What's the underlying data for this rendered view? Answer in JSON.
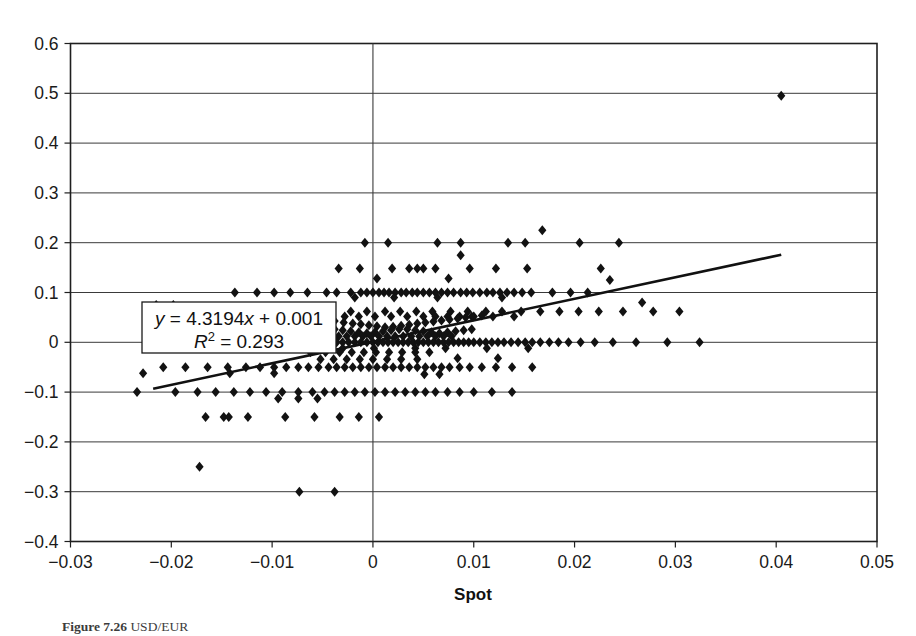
{
  "figure": {
    "caption_prefix": "Figure 7.26",
    "caption_rest": "  USD/EUR",
    "caption_visible": true
  },
  "chart_data": {
    "type": "scatter",
    "title": "",
    "xlabel": "Spot",
    "ylabel": "",
    "xlim": [
      -0.03,
      0.05
    ],
    "ylim": [
      -0.4,
      0.6
    ],
    "xticks": [
      "-0.03",
      "-0.02",
      "-0.01",
      "0",
      "0.01",
      "0.02",
      "0.03",
      "0.04",
      "0.05"
    ],
    "xtick_values": [
      -0.03,
      -0.02,
      -0.01,
      0,
      0.01,
      0.02,
      0.03,
      0.04,
      0.05
    ],
    "yticks": [
      "0.6",
      "0.5",
      "0.4",
      "0.3",
      "0.2",
      "0.1",
      "0",
      "-0.1",
      "-0.2",
      "-0.3",
      "-0.4"
    ],
    "ytick_values": [
      0.6,
      0.5,
      0.4,
      0.3,
      0.2,
      0.1,
      0,
      -0.1,
      -0.2,
      -0.3,
      -0.4
    ],
    "grid": {
      "horizontal": true,
      "vertical": false,
      "zero_vertical_line": true
    },
    "legend": {
      "present": false,
      "position": "none"
    },
    "annotations": [
      {
        "name": "regression-equation",
        "line1": "y = 4.3194x + 0.001",
        "line2": "R2 = 0.293",
        "equation_lhs": "y",
        "equation_rhs": " = 4.3194",
        "equation_var": "x",
        "equation_const": " + 0.001",
        "r2_symbol": "R",
        "r2_exp": "2",
        "r2_value": " = 0.293",
        "boxed": true
      }
    ],
    "trendline": {
      "type": "linear",
      "slope": 4.3194,
      "intercept": 0.001,
      "r_squared": 0.293,
      "x_start": -0.0218,
      "x_end": 0.0405,
      "y_start": -0.0932,
      "y_end": 0.1759
    },
    "marker": {
      "shape": "diamond",
      "color": "#121212",
      "size": 5
    },
    "points": [
      [
        0.0405,
        0.495
      ],
      [
        0.0168,
        0.225
      ],
      [
        0.0134,
        0.2
      ],
      [
        0.0205,
        0.2
      ],
      [
        0.0244,
        0.2
      ],
      [
        0.0064,
        0.2
      ],
      [
        0.0087,
        0.2
      ],
      [
        0.0015,
        0.2
      ],
      [
        0.0151,
        0.2
      ],
      [
        -0.0008,
        0.2
      ],
      [
        0.0087,
        0.175
      ],
      [
        0.0226,
        0.148
      ],
      [
        0.0019,
        0.148
      ],
      [
        -0.0034,
        0.148
      ],
      [
        -0.0013,
        0.148
      ],
      [
        0.0036,
        0.148
      ],
      [
        0.0044,
        0.148
      ],
      [
        0.005,
        0.148
      ],
      [
        0.0062,
        0.148
      ],
      [
        0.0096,
        0.148
      ],
      [
        0.0122,
        0.148
      ],
      [
        0.0153,
        0.148
      ],
      [
        0.0075,
        0.128
      ],
      [
        0.0004,
        0.128
      ],
      [
        0.0235,
        0.125
      ],
      [
        -0.0046,
        0.1
      ],
      [
        -0.0036,
        0.1
      ],
      [
        -0.0022,
        0.1
      ],
      [
        -0.0012,
        0.1
      ],
      [
        -0.0006,
        0.1
      ],
      [
        0.0,
        0.1
      ],
      [
        0.0006,
        0.1
      ],
      [
        0.0011,
        0.1
      ],
      [
        0.0016,
        0.1
      ],
      [
        0.0022,
        0.1
      ],
      [
        0.0028,
        0.1
      ],
      [
        0.0033,
        0.1
      ],
      [
        0.0039,
        0.1
      ],
      [
        0.0044,
        0.1
      ],
      [
        0.005,
        0.1
      ],
      [
        0.0056,
        0.1
      ],
      [
        0.0062,
        0.1
      ],
      [
        0.0068,
        0.1
      ],
      [
        0.0074,
        0.1
      ],
      [
        0.008,
        0.1
      ],
      [
        0.0087,
        0.1
      ],
      [
        0.0093,
        0.1
      ],
      [
        0.0099,
        0.1
      ],
      [
        0.0106,
        0.1
      ],
      [
        0.0113,
        0.1
      ],
      [
        0.0119,
        0.1
      ],
      [
        0.0126,
        0.1
      ],
      [
        0.0133,
        0.1
      ],
      [
        0.014,
        0.1
      ],
      [
        0.0148,
        0.1
      ],
      [
        0.0157,
        0.1
      ],
      [
        -0.0065,
        0.1
      ],
      [
        -0.0082,
        0.1
      ],
      [
        -0.0098,
        0.1
      ],
      [
        -0.0115,
        0.1
      ],
      [
        -0.0137,
        0.1
      ],
      [
        0.0178,
        0.1
      ],
      [
        0.0196,
        0.1
      ],
      [
        0.0213,
        0.1
      ],
      [
        0.0064,
        0.09
      ],
      [
        0.0128,
        0.09
      ],
      [
        -0.0018,
        0.09
      ],
      [
        0.0021,
        0.09
      ],
      [
        0.0267,
        0.08
      ],
      [
        -0.0215,
        0.075
      ],
      [
        -0.0198,
        0.075
      ],
      [
        -0.0062,
        0.062
      ],
      [
        -0.0041,
        0.062
      ],
      [
        -0.0022,
        0.062
      ],
      [
        -0.0006,
        0.062
      ],
      [
        0.0012,
        0.062
      ],
      [
        0.0027,
        0.062
      ],
      [
        0.0043,
        0.062
      ],
      [
        0.0059,
        0.062
      ],
      [
        0.0077,
        0.062
      ],
      [
        0.0094,
        0.062
      ],
      [
        0.0112,
        0.062
      ],
      [
        0.0128,
        0.062
      ],
      [
        0.0147,
        0.062
      ],
      [
        0.0166,
        0.062
      ],
      [
        0.0185,
        0.062
      ],
      [
        0.0204,
        0.062
      ],
      [
        0.0224,
        0.062
      ],
      [
        0.0248,
        0.062
      ],
      [
        0.0278,
        0.062
      ],
      [
        0.0304,
        0.062
      ],
      [
        -0.0082,
        0.062
      ],
      [
        -0.0104,
        0.062
      ],
      [
        -0.0126,
        0.062
      ],
      [
        0.005,
        0.052
      ],
      [
        0.0062,
        0.052
      ],
      [
        0.0074,
        0.052
      ],
      [
        0.0086,
        0.052
      ],
      [
        0.0098,
        0.052
      ],
      [
        0.0034,
        0.052
      ],
      [
        0.0018,
        0.052
      ],
      [
        0.0002,
        0.052
      ],
      [
        -0.0014,
        0.052
      ],
      [
        -0.0028,
        0.052
      ],
      [
        -0.0042,
        0.052
      ],
      [
        0.0119,
        0.052
      ],
      [
        0.014,
        0.052
      ],
      [
        -0.0049,
        0.045
      ],
      [
        -0.0038,
        0.043
      ],
      [
        -0.0029,
        0.04
      ],
      [
        -0.002,
        0.038
      ],
      [
        -0.0012,
        0.036
      ],
      [
        -0.0004,
        0.034
      ],
      [
        0.0004,
        0.032
      ],
      [
        0.0012,
        0.03
      ],
      [
        0.002,
        0.031
      ],
      [
        0.0028,
        0.033
      ],
      [
        0.0036,
        0.035
      ],
      [
        0.0044,
        0.038
      ],
      [
        0.0052,
        0.04
      ],
      [
        0.006,
        0.042
      ],
      [
        0.0068,
        0.044
      ],
      [
        0.0076,
        0.046
      ],
      [
        0.0084,
        0.048
      ],
      [
        0.0092,
        0.05
      ],
      [
        0.01,
        0.052
      ],
      [
        0.0108,
        0.054
      ],
      [
        -0.0046,
        0.028
      ],
      [
        -0.0038,
        0.026
      ],
      [
        -0.003,
        0.024
      ],
      [
        -0.0022,
        0.022
      ],
      [
        -0.0014,
        0.02
      ],
      [
        -0.0006,
        0.018
      ],
      [
        0.0002,
        0.02
      ],
      [
        0.001,
        0.022
      ],
      [
        0.0018,
        0.024
      ],
      [
        0.0026,
        0.026
      ],
      [
        0.0034,
        0.026
      ],
      [
        0.0042,
        0.024
      ],
      [
        0.005,
        0.022
      ],
      [
        0.0058,
        0.02
      ],
      [
        0.0066,
        0.018
      ],
      [
        0.0074,
        0.02
      ],
      [
        0.0082,
        0.022
      ],
      [
        0.009,
        0.024
      ],
      [
        0.0098,
        0.026
      ],
      [
        -0.0042,
        0.012
      ],
      [
        -0.0034,
        0.012
      ],
      [
        -0.0026,
        0.012
      ],
      [
        -0.0018,
        0.012
      ],
      [
        -0.001,
        0.012
      ],
      [
        -0.0002,
        0.012
      ],
      [
        0.0006,
        0.012
      ],
      [
        0.0014,
        0.012
      ],
      [
        0.0022,
        0.012
      ],
      [
        0.003,
        0.012
      ],
      [
        0.0038,
        0.012
      ],
      [
        0.0046,
        0.012
      ],
      [
        0.0054,
        0.012
      ],
      [
        0.0062,
        0.012
      ],
      [
        0.007,
        0.012
      ],
      [
        0.0078,
        0.012
      ],
      [
        -0.0072,
        0.012
      ],
      [
        -0.0088,
        0.012
      ],
      [
        -0.0219,
        0.0
      ],
      [
        -0.02,
        0.0
      ],
      [
        -0.0182,
        0.0
      ],
      [
        -0.0164,
        0.0
      ],
      [
        -0.0146,
        0.0
      ],
      [
        -0.013,
        0.0
      ],
      [
        -0.0116,
        0.0
      ],
      [
        -0.0102,
        0.0
      ],
      [
        -0.009,
        0.0
      ],
      [
        -0.0078,
        0.0
      ],
      [
        -0.0068,
        0.0
      ],
      [
        -0.0058,
        0.0
      ],
      [
        -0.0048,
        0.0
      ],
      [
        -0.0042,
        0.0
      ],
      [
        -0.0036,
        0.0
      ],
      [
        -0.003,
        0.0
      ],
      [
        -0.0024,
        0.0
      ],
      [
        -0.0018,
        0.0
      ],
      [
        -0.0012,
        0.0
      ],
      [
        -0.0006,
        0.0
      ],
      [
        0.0,
        0.0
      ],
      [
        0.0005,
        0.0
      ],
      [
        0.001,
        0.0
      ],
      [
        0.0015,
        0.0
      ],
      [
        0.002,
        0.0
      ],
      [
        0.0025,
        0.0
      ],
      [
        0.003,
        0.0
      ],
      [
        0.0035,
        0.0
      ],
      [
        0.004,
        0.0
      ],
      [
        0.0045,
        0.0
      ],
      [
        0.005,
        0.0
      ],
      [
        0.0055,
        0.0
      ],
      [
        0.006,
        0.0
      ],
      [
        0.0065,
        0.0
      ],
      [
        0.007,
        0.0
      ],
      [
        0.0075,
        0.0
      ],
      [
        0.008,
        0.0
      ],
      [
        0.0085,
        0.0
      ],
      [
        0.009,
        0.0
      ],
      [
        0.0095,
        0.0
      ],
      [
        0.01,
        0.0
      ],
      [
        0.0106,
        0.0
      ],
      [
        0.0112,
        0.0
      ],
      [
        0.0118,
        0.0
      ],
      [
        0.0124,
        0.0
      ],
      [
        0.013,
        0.0
      ],
      [
        0.0137,
        0.0
      ],
      [
        0.0144,
        0.0
      ],
      [
        0.0151,
        0.0
      ],
      [
        0.0158,
        0.0
      ],
      [
        0.0166,
        0.0
      ],
      [
        0.0175,
        0.0
      ],
      [
        0.0184,
        0.0
      ],
      [
        0.0194,
        0.0
      ],
      [
        0.0206,
        0.0
      ],
      [
        0.022,
        0.0
      ],
      [
        0.0238,
        0.0
      ],
      [
        0.0261,
        0.0
      ],
      [
        0.0292,
        0.0
      ],
      [
        0.0324,
        0.0
      ],
      [
        0.0113,
        -0.012
      ],
      [
        0.0154,
        -0.012
      ],
      [
        -0.003,
        -0.012
      ],
      [
        0.0001,
        -0.012
      ],
      [
        0.0042,
        -0.012
      ],
      [
        0.0072,
        -0.012
      ],
      [
        -0.0062,
        -0.02
      ],
      [
        -0.0047,
        -0.02
      ],
      [
        -0.0033,
        -0.02
      ],
      [
        -0.0021,
        -0.02
      ],
      [
        -0.0009,
        -0.02
      ],
      [
        0.0003,
        -0.02
      ],
      [
        0.0016,
        -0.02
      ],
      [
        0.0029,
        -0.02
      ],
      [
        0.0042,
        -0.02
      ],
      [
        0.0056,
        -0.02
      ],
      [
        -0.0052,
        -0.034
      ],
      [
        -0.0039,
        -0.034
      ],
      [
        -0.0026,
        -0.034
      ],
      [
        -0.0013,
        -0.034
      ],
      [
        0.0,
        -0.034
      ],
      [
        0.0014,
        -0.034
      ],
      [
        0.0028,
        -0.034
      ],
      [
        0.0044,
        -0.034
      ],
      [
        0.0084,
        -0.032
      ],
      [
        0.0124,
        -0.032
      ],
      [
        -0.0208,
        -0.05
      ],
      [
        -0.0186,
        -0.05
      ],
      [
        -0.0164,
        -0.05
      ],
      [
        -0.0144,
        -0.05
      ],
      [
        -0.0126,
        -0.05
      ],
      [
        -0.0112,
        -0.05
      ],
      [
        -0.0098,
        -0.05
      ],
      [
        -0.0086,
        -0.05
      ],
      [
        -0.0074,
        -0.05
      ],
      [
        -0.0064,
        -0.05
      ],
      [
        -0.0054,
        -0.05
      ],
      [
        -0.0044,
        -0.05
      ],
      [
        -0.0036,
        -0.05
      ],
      [
        -0.0028,
        -0.05
      ],
      [
        -0.002,
        -0.05
      ],
      [
        -0.0012,
        -0.05
      ],
      [
        -0.0004,
        -0.05
      ],
      [
        0.0004,
        -0.05
      ],
      [
        0.0012,
        -0.05
      ],
      [
        0.002,
        -0.05
      ],
      [
        0.0028,
        -0.05
      ],
      [
        0.0036,
        -0.05
      ],
      [
        0.0044,
        -0.05
      ],
      [
        0.0052,
        -0.05
      ],
      [
        0.006,
        -0.05
      ],
      [
        0.0068,
        -0.05
      ],
      [
        0.0076,
        -0.05
      ],
      [
        0.0086,
        -0.05
      ],
      [
        0.0096,
        -0.05
      ],
      [
        0.0108,
        -0.05
      ],
      [
        0.0122,
        -0.05
      ],
      [
        0.0138,
        -0.05
      ],
      [
        0.0158,
        -0.05
      ],
      [
        -0.0228,
        -0.062
      ],
      [
        -0.0142,
        -0.062
      ],
      [
        -0.0098,
        -0.062
      ],
      [
        0.0051,
        -0.064
      ],
      [
        0.0066,
        -0.064
      ],
      [
        -0.0234,
        -0.1
      ],
      [
        -0.0196,
        -0.1
      ],
      [
        -0.0174,
        -0.1
      ],
      [
        -0.0156,
        -0.1
      ],
      [
        -0.0138,
        -0.1
      ],
      [
        -0.0122,
        -0.1
      ],
      [
        -0.0106,
        -0.1
      ],
      [
        -0.009,
        -0.1
      ],
      [
        -0.0074,
        -0.1
      ],
      [
        -0.006,
        -0.1
      ],
      [
        -0.0048,
        -0.1
      ],
      [
        -0.0038,
        -0.1
      ],
      [
        -0.0028,
        -0.1
      ],
      [
        -0.0018,
        -0.1
      ],
      [
        -0.0008,
        -0.1
      ],
      [
        0.0002,
        -0.1
      ],
      [
        0.0012,
        -0.1
      ],
      [
        0.0022,
        -0.1
      ],
      [
        0.0032,
        -0.1
      ],
      [
        0.0042,
        -0.1
      ],
      [
        0.0052,
        -0.1
      ],
      [
        0.0062,
        -0.1
      ],
      [
        0.0074,
        -0.1
      ],
      [
        0.0086,
        -0.1
      ],
      [
        0.01,
        -0.1
      ],
      [
        0.0118,
        -0.1
      ],
      [
        0.0138,
        -0.1
      ],
      [
        -0.0094,
        -0.113
      ],
      [
        -0.0074,
        -0.113
      ],
      [
        -0.0055,
        -0.113
      ],
      [
        -0.0166,
        -0.15
      ],
      [
        -0.0148,
        -0.15
      ],
      [
        -0.0143,
        -0.15
      ],
      [
        -0.0124,
        -0.15
      ],
      [
        -0.0087,
        -0.15
      ],
      [
        -0.0058,
        -0.15
      ],
      [
        -0.0033,
        -0.15
      ],
      [
        -0.0014,
        -0.15
      ],
      [
        0.0006,
        -0.15
      ],
      [
        -0.0172,
        -0.25
      ],
      [
        -0.0073,
        -0.3
      ],
      [
        -0.0038,
        -0.3
      ]
    ]
  }
}
